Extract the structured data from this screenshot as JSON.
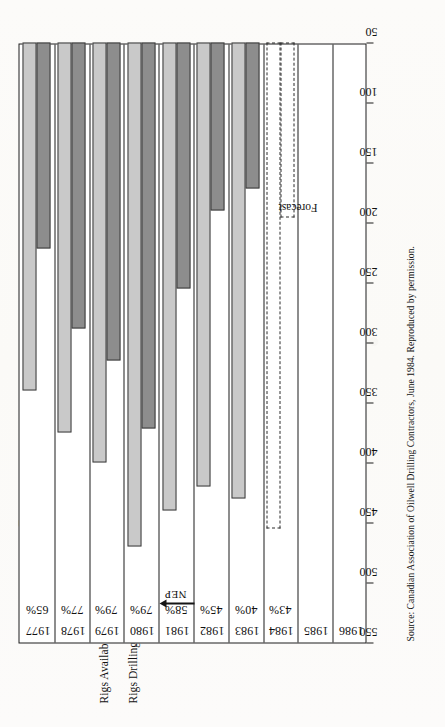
{
  "figure": {
    "label": "Figure",
    "number": "9.4",
    "title_line1": "Western Canada Yearly Average",
    "title_line2": "Drilling Rig Utilization"
  },
  "legend": {
    "items": [
      {
        "label": "Rigs Available:",
        "swatch": "light-gray",
        "color": "#c9c9c9"
      },
      {
        "label": "Rigs Drilling:",
        "swatch": "dark-gray",
        "color": "#8d8d8d"
      }
    ]
  },
  "annotations": {
    "forecast": "Forecast",
    "nep": "NEP"
  },
  "source": {
    "text": "Source: Canadian Association of Oilwell Drilling Contractors, June 1984. Reproduced by permission."
  },
  "chart_data": {
    "type": "bar",
    "orientation": "horizontal",
    "title": "Western Canada Yearly Average Drilling Rig Utilization",
    "xlabel": "",
    "ylabel": "",
    "categories": [
      "1977",
      "1978",
      "1979",
      "1980",
      "1981",
      "1982",
      "1983",
      "1984",
      "1985",
      "1986"
    ],
    "tick_labels": [
      "550",
      "500",
      "450",
      "400",
      "350",
      "300",
      "250",
      "200",
      "150",
      "100",
      "50"
    ],
    "axis_min": 50,
    "axis_max": 550,
    "axis_reversed": true,
    "grid": false,
    "legend_position": "top-left",
    "series": [
      {
        "name": "Rigs Available",
        "color": "#c9c9c9",
        "values": [
          340,
          375,
          400,
          470,
          440,
          420,
          430,
          455,
          null,
          null
        ]
      },
      {
        "name": "Rigs Drilling",
        "color": "#8d8d8d",
        "values": [
          222,
          288,
          315,
          372,
          255,
          190,
          172,
          196,
          null,
          null
        ]
      }
    ],
    "utilization_labels": [
      {
        "year": "1977",
        "value": "65%"
      },
      {
        "year": "1978",
        "value": "77%"
      },
      {
        "year": "1979",
        "value": "79%"
      },
      {
        "year": "1980",
        "value": "79%"
      },
      {
        "year": "1981",
        "value": "58%"
      },
      {
        "year": "1982",
        "value": "45%"
      },
      {
        "year": "1983",
        "value": "40%"
      },
      {
        "year": "1984",
        "value": "43%"
      }
    ],
    "forecast_from": "1984",
    "annotations": [
      {
        "text": "Forecast",
        "at": "1984-1986 dashed region"
      },
      {
        "text": "NEP",
        "at": "1980/1981 boundary"
      }
    ]
  }
}
